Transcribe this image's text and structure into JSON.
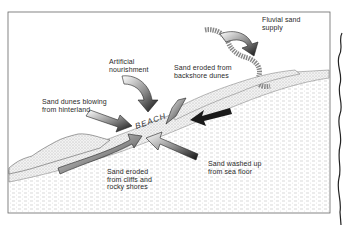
{
  "diagram": {
    "type": "coastal sand sources illustration",
    "center_label": "BEACH",
    "labels": [
      {
        "id": "fluvial",
        "text": "Fluvial sand\nsupply"
      },
      {
        "id": "artificial",
        "text": "Artificial\nnourishment"
      },
      {
        "id": "backshore",
        "text": "Sand eroded from\nbackshore dunes"
      },
      {
        "id": "hinterland",
        "text": "Sand dunes blowing\nfrom hinterland"
      },
      {
        "id": "cliffs",
        "text": "Sand eroded\nfrom cliffs and\nrocky shores"
      },
      {
        "id": "seafloor",
        "text": "Sand washed up\nfrom sea floor"
      }
    ],
    "colors": {
      "ink": "#1a1a1a",
      "frame": "#555555",
      "background": "#ffffff",
      "stipple": "#9a9a9a"
    }
  }
}
